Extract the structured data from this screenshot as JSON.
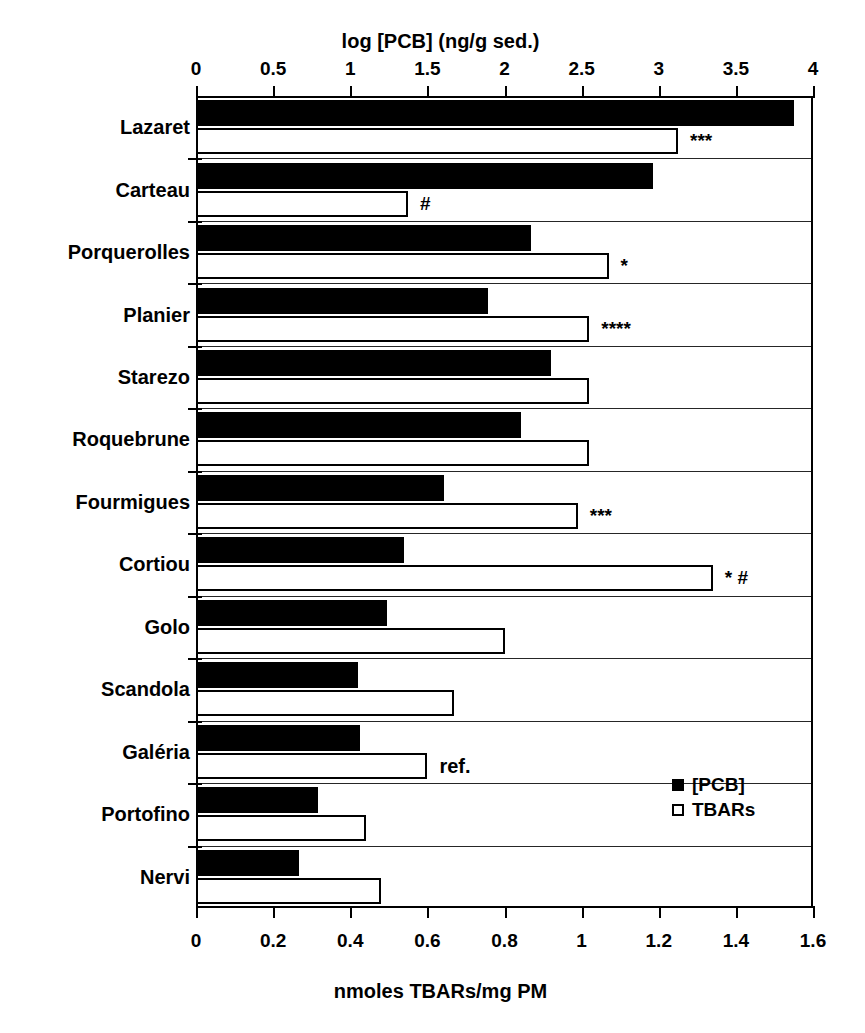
{
  "chart_data": {
    "type": "bar",
    "orientation": "horizontal",
    "title": "",
    "grid": false,
    "legend_position": "inside-bottom-right",
    "categories": [
      "Lazaret",
      "Carteau",
      "Porquerolles",
      "Planier",
      "Starezo",
      "Roquebrune",
      "Fourmigues",
      "Cortiou",
      "Golo",
      "Scandola",
      "Galéria",
      "Portofino",
      "Nervi"
    ],
    "top_axis": {
      "label": "log [PCB] (ng/g sed.)",
      "ticks": [
        "0",
        "0.5",
        "1",
        "1.5",
        "2",
        "2.5",
        "3",
        "3.5",
        "4"
      ],
      "tickvalues": [
        0,
        0.5,
        1,
        1.5,
        2,
        2.5,
        3,
        3.5,
        4
      ],
      "lim": [
        0,
        4
      ]
    },
    "bottom_axis": {
      "label": "nmoles TBARs/mg PM",
      "ticks": [
        "0",
        "0.2",
        "0.4",
        "0.6",
        "0.8",
        "1",
        "1.2",
        "1.4",
        "1.6"
      ],
      "tickvalues": [
        0,
        0.2,
        0.4,
        0.6,
        0.8,
        1,
        1.2,
        1.4,
        1.6
      ],
      "lim": [
        0,
        1.6
      ]
    },
    "series": [
      {
        "name": "[PCB]",
        "axis": "top",
        "style": "filled",
        "color": "#000000",
        "values": [
          3.88,
          2.96,
          2.17,
          1.89,
          2.3,
          2.11,
          1.61,
          1.35,
          1.24,
          1.05,
          1.06,
          0.79,
          0.67
        ]
      },
      {
        "name": "TBARs",
        "axis": "bottom",
        "style": "open",
        "color": "#ffffff",
        "values": [
          1.25,
          0.55,
          1.07,
          1.02,
          1.02,
          1.02,
          0.99,
          1.34,
          0.8,
          0.67,
          0.6,
          0.44,
          0.48
        ]
      }
    ],
    "annotations": [
      {
        "category": "Lazaret",
        "series": "TBARs",
        "text": "***"
      },
      {
        "category": "Carteau",
        "series": "TBARs",
        "text": "#"
      },
      {
        "category": "Porquerolles",
        "series": "TBARs",
        "text": "*"
      },
      {
        "category": "Planier",
        "series": "TBARs",
        "text": "****"
      },
      {
        "category": "Fourmigues",
        "series": "TBARs",
        "text": "***"
      },
      {
        "category": "Cortiou",
        "series": "TBARs",
        "text": "* #"
      },
      {
        "category": "Galéria",
        "series": "TBARs",
        "text": "ref."
      }
    ]
  },
  "legend": {
    "items": [
      {
        "label": "[PCB]",
        "marker": "filled-square"
      },
      {
        "label": "TBARs",
        "marker": "open-square"
      }
    ]
  },
  "caption": ""
}
